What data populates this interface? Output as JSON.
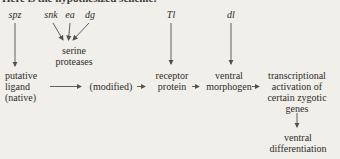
{
  "colors": {
    "background": "#f0efea",
    "text": "#2f2d29",
    "line": "#54504a"
  },
  "clipped_heading": "Here is the hypothesized scheme:",
  "genes": {
    "spz": "spz",
    "snk": "snk",
    "ea": "ea",
    "dg": "dg",
    "Tl": "Tl",
    "dl": "dl"
  },
  "proteases": {
    "line1": "serine",
    "line2": "proteases"
  },
  "flow": {
    "ligand": {
      "line1": "putative",
      "line2": "ligand",
      "line3": "(native)"
    },
    "modified": "(modified)",
    "receptor": {
      "line1": "receptor",
      "line2": "protein"
    },
    "morphogen": {
      "line1": "ventral",
      "line2": "morphogen"
    },
    "transcription": {
      "line1": "transcriptional",
      "line2": "activation of",
      "line3": "certain zygotic",
      "line4": "genes"
    },
    "outcome": {
      "line1": "ventral",
      "line2": "differentiation"
    }
  }
}
